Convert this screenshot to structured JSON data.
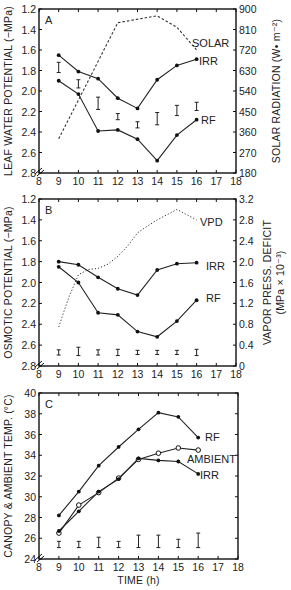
{
  "chart_data": [
    {
      "type": "line",
      "panel": "A",
      "xlabel": "",
      "x": [
        9,
        10,
        11,
        12,
        13,
        14,
        15,
        16
      ],
      "xlim": [
        8,
        18
      ],
      "xticks": [
        "8",
        "9",
        "10",
        "11",
        "12",
        "13",
        "14",
        "15",
        "16",
        "17",
        "18"
      ],
      "ylabel": "LEAF WATER POTENTIAL (−MPa)",
      "ylim": [
        1.2,
        2.8
      ],
      "y_inverted": true,
      "yticks": [
        "1.2",
        "1.4",
        "1.6",
        "1.8",
        "2.0",
        "2.2",
        "2.4",
        "2.6",
        "2.8"
      ],
      "y2label": "SOLAR RADIATION (W• m⁻²)",
      "y2lim": [
        180,
        900
      ],
      "y2ticks": [
        "900",
        "810",
        "720",
        "630",
        "540",
        "450",
        "360",
        "270",
        "180"
      ],
      "series": [
        {
          "name": "IRR",
          "axis": "left",
          "style": "solid-filled",
          "values": [
            1.65,
            1.81,
            1.88,
            2.07,
            2.17,
            1.89,
            1.75,
            1.69
          ]
        },
        {
          "name": "RF",
          "axis": "left",
          "style": "solid-filled",
          "values": [
            1.9,
            2.03,
            2.39,
            2.38,
            2.47,
            2.68,
            2.43,
            2.28
          ]
        },
        {
          "name": "SOLAR",
          "axis": "right",
          "style": "dashed",
          "x": [
            9,
            12,
            14,
            15,
            16
          ],
          "values": [
            330,
            840,
            870,
            820,
            720
          ]
        }
      ],
      "error_bars": {
        "center": [
          1.77,
          1.93,
          2.12,
          2.25,
          2.33,
          2.27,
          2.19,
          2.15
        ],
        "half": [
          0.05,
          0.04,
          0.06,
          0.03,
          0.03,
          0.06,
          0.05,
          0.04
        ]
      }
    },
    {
      "type": "line",
      "panel": "B",
      "xlabel": "",
      "x": [
        9,
        10,
        11,
        12,
        13,
        14,
        15,
        16
      ],
      "xlim": [
        8,
        18
      ],
      "xticks": [
        "8",
        "9",
        "10",
        "11",
        "12",
        "13",
        "14",
        "15",
        "16",
        "17",
        "18"
      ],
      "ylabel": "OSMOTIC POTENTIAL (−MPa)",
      "ylim": [
        1.2,
        2.8
      ],
      "y_inverted": true,
      "yticks": [
        "1.2",
        "1.4",
        "1.6",
        "1.8",
        "2.0",
        "2.2",
        "2.4",
        "2.6",
        "2.8"
      ],
      "y2label": "VAPOR PRESS. DEFICIT",
      "y2label2": "(MPa × 10⁻³)",
      "y2lim": [
        0,
        3.2
      ],
      "y2ticks": [
        "3.2",
        "2.8",
        "2.4",
        "2.0",
        "1.6",
        "1.2",
        "0.8",
        "0.4",
        "0"
      ],
      "series": [
        {
          "name": "IRR",
          "axis": "left",
          "style": "solid-filled",
          "values": [
            1.8,
            1.83,
            1.95,
            2.06,
            2.12,
            1.88,
            1.82,
            1.81
          ]
        },
        {
          "name": "RF",
          "axis": "left",
          "style": "solid-filled",
          "values": [
            1.85,
            2.0,
            2.29,
            2.31,
            2.47,
            2.52,
            2.37,
            2.17
          ]
        },
        {
          "name": "VPD",
          "axis": "right",
          "style": "dotted",
          "x": [
            9,
            9.5,
            10,
            10.5,
            11,
            11.5,
            12,
            12.5,
            13,
            13.5,
            14,
            14.5,
            15,
            15.5,
            16
          ],
          "values": [
            0.75,
            1.3,
            1.75,
            1.85,
            1.87,
            1.95,
            2.1,
            2.3,
            2.55,
            2.68,
            2.8,
            2.9,
            3.0,
            2.9,
            2.8
          ]
        }
      ],
      "error_bars": {
        "center": [
          2.67,
          2.66,
          2.67,
          2.67,
          2.67,
          2.67,
          2.67,
          2.67
        ],
        "half": [
          0.025,
          0.04,
          0.025,
          0.03,
          0.02,
          0.02,
          0.02,
          0.03
        ]
      }
    },
    {
      "type": "line",
      "panel": "C",
      "xlabel": "TIME (h)",
      "x": [
        9,
        10,
        11,
        12,
        13,
        14,
        15,
        16
      ],
      "xlim": [
        8,
        18
      ],
      "xticks": [
        "8",
        "9",
        "10",
        "11",
        "12",
        "13",
        "14",
        "15",
        "16",
        "17",
        "18"
      ],
      "ylabel": "CANOPY & AMBIENT TEMP. (°C)",
      "ylim": [
        24,
        40
      ],
      "y_inverted": false,
      "yticks": [
        "40",
        "38",
        "36",
        "34",
        "32",
        "30",
        "28",
        "26",
        "24"
      ],
      "series": [
        {
          "name": "RF",
          "axis": "left",
          "style": "solid-filled",
          "values": [
            28.2,
            30.5,
            33.0,
            34.8,
            36.5,
            38.1,
            37.7,
            35.7
          ]
        },
        {
          "name": "AMBIENT",
          "axis": "left",
          "style": "solid-open",
          "values": [
            26.5,
            29.2,
            30.4,
            31.8,
            33.6,
            34.2,
            34.7,
            34.5
          ]
        },
        {
          "name": "IRR",
          "axis": "left",
          "style": "solid-filled",
          "values": [
            26.7,
            28.6,
            30.5,
            31.7,
            33.7,
            33.5,
            33.4,
            32.2
          ]
        }
      ],
      "error_bars": {
        "center": [
          25.4,
          25.4,
          25.6,
          25.4,
          25.7,
          25.7,
          25.5,
          25.8
        ],
        "half": [
          0.3,
          0.3,
          0.5,
          0.3,
          0.6,
          0.6,
          0.4,
          0.7
        ]
      }
    }
  ]
}
